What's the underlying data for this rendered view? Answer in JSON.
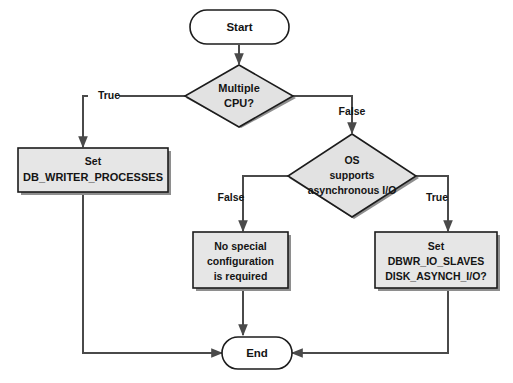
{
  "diagram": {
    "colors": {
      "process_fill": "#e6e6e6",
      "decision_fill": "#e2e2e2",
      "terminator_fill": "#ffffff",
      "outline": "#1c1c1c",
      "connector": "#4a4a4a",
      "shadow": "#8e8e8e",
      "text": "#141414",
      "background": "#ffffff"
    },
    "nodes": {
      "start": {
        "type": "terminator",
        "label": "Start"
      },
      "decision_cpu": {
        "type": "decision",
        "line1": "Multiple",
        "line2": "CPU?"
      },
      "process_dbwriter": {
        "type": "process",
        "line1": "Set",
        "line2": "DB_WRITER_PROCESSES"
      },
      "decision_async": {
        "type": "decision",
        "line1": "OS",
        "line2": "supports",
        "line3": "asynchronous I/O"
      },
      "process_nospecial": {
        "type": "process",
        "line1": "No special",
        "line2": "configuration",
        "line3": "is required"
      },
      "process_ioslaves": {
        "type": "process",
        "line1": "Set",
        "line2": "DBWR_IO_SLAVES",
        "line3": "DISK_ASYNCH_I/O?"
      },
      "end": {
        "type": "terminator",
        "label": "End"
      }
    },
    "edge_labels": {
      "cpu_true": "True",
      "cpu_false": "False",
      "async_false": "False",
      "async_true": "True"
    }
  }
}
